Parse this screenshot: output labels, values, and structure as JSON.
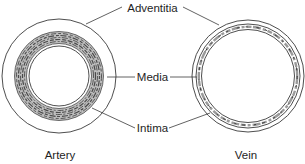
{
  "diagram": {
    "type": "blood-vessel-cross-section-comparison",
    "labels": {
      "adventitia": "Adventitia",
      "media": "Media",
      "intima": "Intima"
    },
    "vessels": [
      {
        "id": "artery",
        "caption": "Artery"
      },
      {
        "id": "vein",
        "caption": "Vein"
      }
    ],
    "colors": {
      "line": "#3a3a3a",
      "media_texture": "#555555",
      "text": "#1e1e1e",
      "background": "#ffffff"
    }
  }
}
